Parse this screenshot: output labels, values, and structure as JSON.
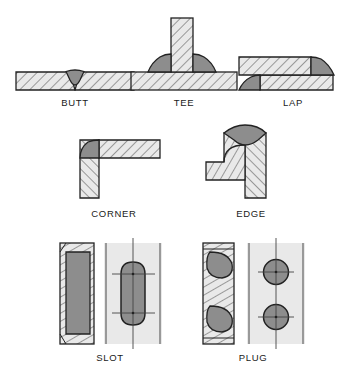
{
  "figure": {
    "kind": "welding-joint-types-diagram",
    "background_color": "#ffffff",
    "plate_fill": "#e9e9e9",
    "hatch_color": "#555555",
    "bead_fill": "#8d8d8d",
    "outline_color": "#222222",
    "centerline_color": "#444444",
    "label_color": "#1a1a1a"
  },
  "rows": [
    {
      "name": "row-1",
      "joints": [
        "butt",
        "tee",
        "lap"
      ]
    },
    {
      "name": "row-2",
      "joints": [
        "corner",
        "edge"
      ]
    },
    {
      "name": "row-3",
      "joints": [
        "slot",
        "plug"
      ]
    }
  ],
  "joints": {
    "butt": {
      "label": "BUTT",
      "description": "Two plates aligned edge to edge in the same plane with a V groove weld bead at the joint",
      "views": [
        "section"
      ],
      "bead_shape": "v-groove-bead",
      "bead_count": 1,
      "label_x": 75,
      "label_y": 97
    },
    "tee": {
      "label": "TEE",
      "description": "Vertical plate standing perpendicular on a horizontal plate with fillet welds on both sides",
      "views": [
        "section"
      ],
      "bead_shape": "fillet-triangle",
      "bead_count": 2,
      "label_x": 184,
      "label_y": 97
    },
    "lap": {
      "label": "LAP",
      "description": "Two plates overlapping with fillet welds at each exposed plate edge",
      "views": [
        "section"
      ],
      "bead_shape": "fillet-triangle",
      "bead_count": 2,
      "label_x": 293,
      "label_y": 97
    },
    "corner": {
      "label": "CORNER",
      "description": "Two plates meeting at a ninety degree outside corner with a single weld at the corner",
      "views": [
        "section"
      ],
      "bead_shape": "corner-triangle",
      "bead_count": 1,
      "label_x": 114,
      "label_y": 208
    },
    "edge": {
      "label": "EDGE",
      "description": "Two plates joined along their adjacent edges with a weld bead across the top edge",
      "views": [
        "section"
      ],
      "bead_shape": "edge-bead",
      "bead_count": 1,
      "label_x": 251,
      "label_y": 208
    },
    "slot": {
      "label": "SLOT",
      "description": "Elongated slot cut through the upper plate and filled with weld metal, shown in section and plan view",
      "views": [
        "section",
        "plan"
      ],
      "bead_shape": "slot-fill",
      "bead_count": 1,
      "plan_feature": "stadium-slot-outline-with-centerlines",
      "label_x": 110,
      "label_y": 352
    },
    "plug": {
      "label": "PLUG",
      "description": "Round holes through the upper plate filled with weld metal, shown in section and plan view",
      "views": [
        "section",
        "plan"
      ],
      "bead_shape": "plug-fill",
      "bead_count": 2,
      "plan_feature": "two-circles-with-crosshair-centerlines",
      "label_x": 253,
      "label_y": 352
    }
  }
}
